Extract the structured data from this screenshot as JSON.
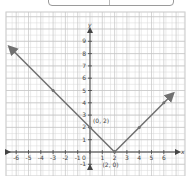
{
  "chart_data": {
    "type": "line",
    "title": "",
    "function": "y = |x - 2|",
    "xlabel": "x",
    "ylabel": "y",
    "xlim": [
      -6.5,
      7
    ],
    "ylim": [
      -1.5,
      10
    ],
    "grid": true,
    "x_ticks": [
      -6,
      -5,
      -4,
      -3,
      -2,
      -1,
      0,
      1,
      2,
      3,
      4,
      5,
      6
    ],
    "y_ticks": [
      -1,
      1,
      2,
      3,
      4,
      5,
      6,
      7,
      8,
      9
    ],
    "series": [
      {
        "name": "y = |x - 2|",
        "x": [
          -6.4,
          -3,
          0,
          2,
          6.6
        ],
        "y": [
          8.4,
          5,
          2,
          0,
          4.6
        ]
      }
    ],
    "points_marked": [
      {
        "x": -3,
        "y": 5
      },
      {
        "x": 0,
        "y": 2
      },
      {
        "x": 2,
        "y": 0
      },
      {
        "x": 4,
        "y": 2
      },
      {
        "x": 6,
        "y": 4
      }
    ],
    "annotations": [
      {
        "text": "(0, 2)",
        "x": 0,
        "y": 2
      },
      {
        "text": "(2, 0)",
        "x": 2,
        "y": 0
      }
    ],
    "colors": {
      "line": "#707070",
      "grid": "#d9d9d9",
      "axis": "#444444"
    }
  },
  "labels": {
    "x_axis": "x",
    "y_axis": "y",
    "ann1": "(0, 2)",
    "ann2": "(2, 0)",
    "x_ticks": [
      "-6",
      "-5",
      "-4",
      "-3",
      "-2",
      "-1",
      "0",
      "1",
      "2",
      "3",
      "4",
      "5",
      "6"
    ],
    "y_ticks": [
      "9",
      "8",
      "7",
      "6",
      "5",
      "4",
      "3",
      "2",
      "1",
      "-1"
    ]
  }
}
